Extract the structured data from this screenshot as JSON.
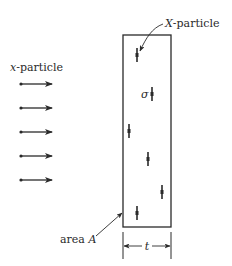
{
  "diagram": {
    "incident_label_var": "x",
    "incident_label_rest": "-particle",
    "target_label_var": "X",
    "target_label_rest": "-particle",
    "cross_section_symbol": "σ",
    "area_label_word": "area ",
    "area_label_var": "A",
    "thickness_symbol": "t",
    "colors": {
      "ink": "#2a2a2a",
      "background": "#ffffff"
    },
    "incident_arrows": [
      {
        "x1": 21,
        "x2": 52,
        "y": 84
      },
      {
        "x1": 21,
        "x2": 52,
        "y": 108
      },
      {
        "x1": 21,
        "x2": 52,
        "y": 132
      },
      {
        "x1": 21,
        "x2": 52,
        "y": 156
      },
      {
        "x1": 21,
        "x2": 52,
        "y": 180
      }
    ],
    "slab": {
      "x": 123,
      "y": 35,
      "width": 48,
      "height": 192
    },
    "target_particles": [
      {
        "x": 137,
        "y": 55
      },
      {
        "x": 152,
        "y": 94
      },
      {
        "x": 129,
        "y": 131
      },
      {
        "x": 148,
        "y": 159
      },
      {
        "x": 162,
        "y": 192
      },
      {
        "x": 137,
        "y": 213
      }
    ]
  }
}
